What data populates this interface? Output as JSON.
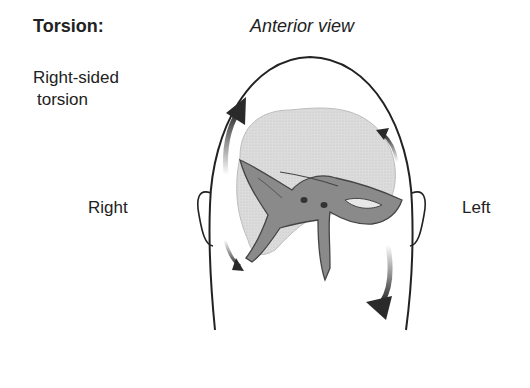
{
  "title": "Torsion:",
  "view_label": "Anterior view",
  "condition_line1": "Right-sided",
  "condition_line2": "torsion",
  "side_right": "Right",
  "side_left": "Left",
  "figure": {
    "arrows": [
      {
        "position": "upper-right side of image (patient right)",
        "direction": "up",
        "size": "large"
      },
      {
        "position": "lower-left of image",
        "direction": "down",
        "size": "small"
      },
      {
        "position": "upper-right of image",
        "direction": "up",
        "size": "small"
      },
      {
        "position": "lower-right of image (patient left)",
        "direction": "down",
        "size": "large"
      }
    ],
    "colors": {
      "outline": "#222222",
      "bone": "#7d7d7d",
      "brain": "#d6d6d6",
      "arrow": "#2a2a2a"
    }
  }
}
